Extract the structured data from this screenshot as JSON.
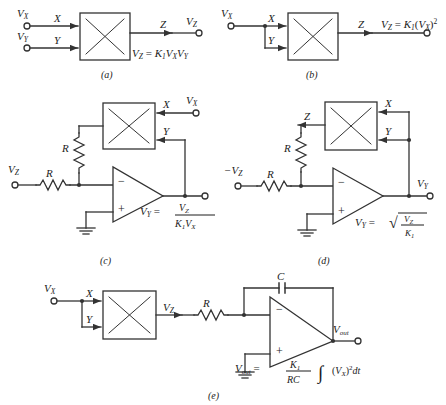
{
  "figure": {
    "stroke_color": "#333333",
    "box_fill": "#ffffff",
    "background": "#ffffff"
  },
  "panels": [
    {
      "caption": "(a)",
      "name": "multiplier",
      "terminals": [
        {
          "label": "V_X",
          "x_sub": "X"
        },
        {
          "label": "V_Y",
          "x_sub": "Y"
        },
        {
          "label": "V_Z",
          "x_sub": "Z"
        }
      ],
      "port_x": "X",
      "port_y": "Y",
      "port_z": "Z",
      "in_label_1": "V",
      "in_sub_1": "X",
      "in_label_2": "V",
      "in_sub_2": "Y",
      "out_label": "V",
      "out_sub": "Z",
      "equation": {
        "lhs": "V",
        "lhs_sub": "Z",
        "eq": "=",
        "rhs": "K",
        "rhs_sub": "1",
        "rhs_tail_1": "V",
        "rhs_tail_1_sub": "X",
        "rhs_tail_2": "V",
        "rhs_tail_2_sub": "Y"
      }
    },
    {
      "caption": "(b)",
      "name": "squarer",
      "port_x": "X",
      "port_y": "Y",
      "port_z": "Z",
      "in_label_1": "V",
      "in_sub_1": "X",
      "equation": {
        "lhs": "V",
        "lhs_sub": "Z",
        "eq": "=",
        "rhs": "K",
        "rhs_sub": "1",
        "paren_open": "(",
        "var": "V",
        "var_sub": "X",
        "paren_close": ")",
        "power": "2"
      }
    },
    {
      "caption": "(c)",
      "name": "divider",
      "port_x": "X",
      "port_y": "Y",
      "resistor_feedback": "R",
      "resistor_input": "R",
      "in_label": "V",
      "in_sub": "Z",
      "x_terminal": "V",
      "x_terminal_sub": "X",
      "opamp_minus": "−",
      "opamp_plus": "+",
      "equation": {
        "lhs": "V",
        "lhs_sub": "Y",
        "eq": "=",
        "num": "V",
        "num_sub": "Z",
        "den_k": "K",
        "den_k_sub": "1",
        "den_v": "V",
        "den_v_sub": "X"
      }
    },
    {
      "caption": "(d)",
      "name": "square-root",
      "port_x": "X",
      "port_y": "Y",
      "port_z": "Z",
      "resistor_feedback": "R",
      "resistor_input": "R",
      "in_label": "−V",
      "in_sub": "Z",
      "out_label": "V",
      "out_sub": "Y",
      "opamp_minus": "−",
      "opamp_plus": "+",
      "equation": {
        "lhs": "V",
        "lhs_sub": "Y",
        "eq": "=",
        "radical": "√",
        "num": "V",
        "num_sub": "Z",
        "den": "K",
        "den_sub": "1"
      }
    },
    {
      "caption": "(e)",
      "name": "squarer-integrator",
      "port_x": "X",
      "port_y": "Y",
      "in_label": "V",
      "in_sub": "X",
      "mid_label": "V",
      "mid_sub": "Z",
      "resistor": "R",
      "capacitor": "C",
      "out_label": "V",
      "out_sub": "out",
      "opamp_minus": "−",
      "opamp_plus": "+",
      "equation": {
        "lhs": "V",
        "lhs_sub": "out",
        "eq": "=",
        "num": "K",
        "num_sub": "1",
        "den": "RC",
        "integral": "∫",
        "paren_open": "(",
        "var": "V",
        "var_sub": "X",
        "paren_close": ")",
        "power": "2",
        "dt": "dt"
      }
    }
  ]
}
